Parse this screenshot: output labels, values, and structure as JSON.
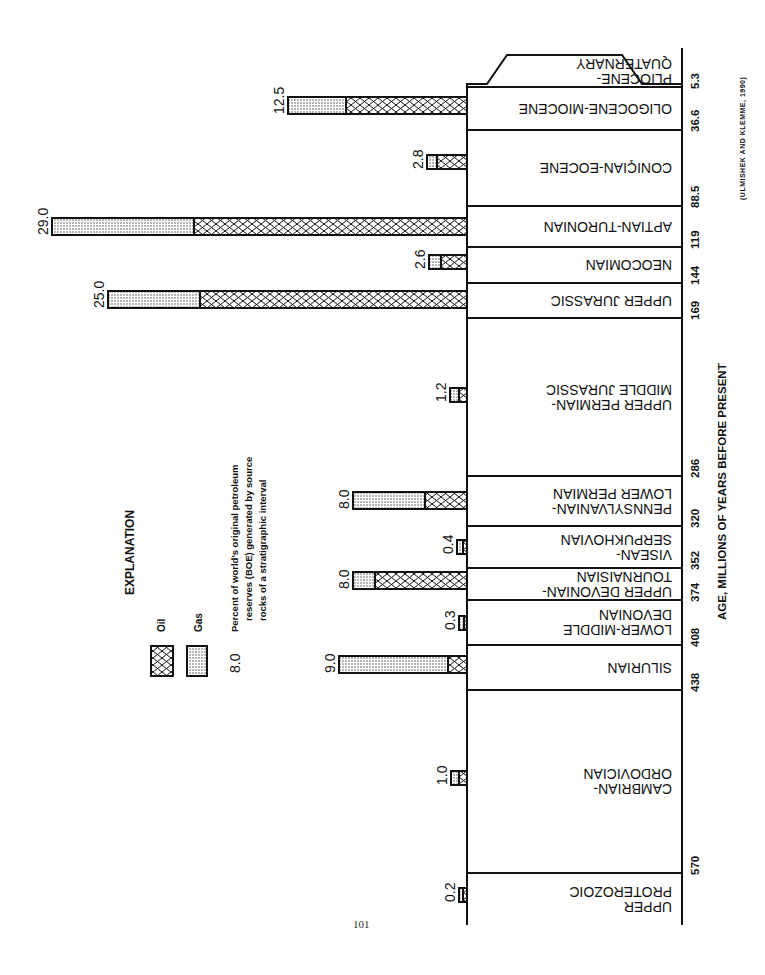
{
  "page": {
    "number": "101"
  },
  "chart_data": {
    "type": "bar",
    "orientation": "horizontal (figure rotated 90°, intervals read top=youngest)",
    "title": "",
    "xlabel": "AGE, MILLIONS OF YEARS BEFORE PRESENT",
    "ylabel": "Percent of world's original petroleum reserves (BOE) generated by source rocks of a stratigraphic interval",
    "source": "(ULMISHEK AND KLEMME, 1990)",
    "legend": {
      "title": "EXPLANATION",
      "entries": [
        {
          "name": "Oil",
          "pattern": "crosshatch"
        },
        {
          "name": "Gas",
          "pattern": "stipple"
        }
      ],
      "example_value": "8.0",
      "example_text": [
        "Percent of world's original petroleum",
        "reserves (BOE) generated by source",
        "rocks of a stratigraphic interval"
      ]
    },
    "age_ticks": [
      "5.3",
      "36.6",
      "88.5",
      "119",
      "144",
      "169",
      "286",
      "320",
      "352",
      "374",
      "408",
      "438",
      "570"
    ],
    "categories": [
      "PLIOCENE-QUATERNARY",
      "OLIGOCENE-MIOCENE",
      "CONIACIAN-EOCENE",
      "APTIAN-TURONIAN",
      "NEOCOMIAN",
      "UPPER JURASSIC",
      "UPPER PERMIAN-MIDDLE JURASSIC",
      "PENNSYLVANIAN-LOWER PERMIAN",
      "VISEAN-SERPUKHOVIAN",
      "UPPER DEVONIAN-TOURNAISIAN",
      "LOWER-MIDDLE DEVONIAN",
      "SILURIAN",
      "CAMBRIAN-ORDOVICIAN",
      "UPPER PROTEROZOIC"
    ],
    "values": [
      null,
      12.5,
      2.8,
      29.0,
      2.6,
      25.0,
      1.2,
      8.0,
      0.4,
      8.0,
      0.3,
      9.0,
      1.0,
      0.2
    ],
    "series": [
      {
        "name": "Oil",
        "values": [
          null,
          8.5,
          2.1,
          19.0,
          1.8,
          18.7,
          0.6,
          2.8,
          0.3,
          6.5,
          0.2,
          1.3,
          0.7,
          0.1
        ]
      },
      {
        "name": "Gas",
        "values": [
          null,
          4.0,
          0.7,
          10.0,
          0.8,
          6.3,
          0.6,
          5.2,
          0.1,
          1.5,
          0.1,
          7.7,
          0.3,
          0.1
        ]
      }
    ],
    "xlim": [
      0,
      30
    ],
    "grid": false
  },
  "intervals": [
    {
      "label_lines": [
        "PLIOCENE-",
        "QUATERNARY"
      ],
      "top": 55,
      "bottom": 87,
      "value": null,
      "split": null,
      "shape": "trapezoid"
    },
    {
      "label_lines": [
        "OLIGOCENE-MIOCENE"
      ],
      "top": 87,
      "bottom": 130,
      "value": "12.5",
      "bar_left": 288,
      "split": 346,
      "bar_y": 97
    },
    {
      "label_lines": [
        "CONIÇIAN-EOCENE"
      ],
      "top": 130,
      "bottom": 206,
      "value": "2.8",
      "bar_left": 427,
      "split": 437,
      "bar_y": 155
    },
    {
      "label_lines": [
        "APTIAN-TURONIAN"
      ],
      "top": 206,
      "bottom": 247,
      "value": "29.0",
      "bar_left": 52,
      "split": 194,
      "bar_y": 218
    },
    {
      "label_lines": [
        "NEOCOMIAN"
      ],
      "top": 247,
      "bottom": 283,
      "value": "2.6",
      "bar_left": 429,
      "split": 441,
      "bar_y": 255
    },
    {
      "label_lines": [
        "UPPER JURASSIC"
      ],
      "top": 283,
      "bottom": 318,
      "value": "25.0",
      "bar_left": 108,
      "split": 200,
      "bar_y": 291
    },
    {
      "label_lines": [
        "UPPER PERMIAN-",
        "MIDDLE JURASSIC"
      ],
      "top": 318,
      "bottom": 476,
      "value": "1.2",
      "bar_left": 450,
      "split": 459,
      "bar_y": 388
    },
    {
      "label_lines": [
        "PENNSYLVANIAN-",
        "LOWER PERMIAN"
      ],
      "top": 476,
      "bottom": 526,
      "value": "8.0",
      "bar_left": 353,
      "split": 425,
      "bar_y": 492
    },
    {
      "label_lines": [
        "VISEAN-",
        "SERPUKHOVIAN"
      ],
      "top": 526,
      "bottom": 568,
      "value": "0.4",
      "bar_left": 457,
      "split": 463,
      "bar_y": 540
    },
    {
      "label_lines": [
        "UPPER DEVONIAN-",
        "TOURNAISIAN"
      ],
      "top": 568,
      "bottom": 600,
      "value": "8.0",
      "bar_left": 353,
      "split": 375,
      "bar_y": 572
    },
    {
      "label_lines": [
        "LOWER-MIDDLE",
        "DEVONIAN"
      ],
      "top": 600,
      "bottom": 645,
      "value": "0.3",
      "bar_left": 459,
      "split": 464,
      "bar_y": 616
    },
    {
      "label_lines": [
        "SILURIAN"
      ],
      "top": 645,
      "bottom": 690,
      "value": "9.0",
      "bar_left": 339,
      "split": 448,
      "bar_y": 656
    },
    {
      "label_lines": [
        "CAMBRIAN-",
        "ORDOVICIAN"
      ],
      "top": 690,
      "bottom": 873,
      "value": "1.0",
      "bar_left": 451,
      "split": 459,
      "bar_y": 771
    },
    {
      "label_lines": [
        "UPPER",
        "PROTEROZOIC"
      ],
      "top": 873,
      "bottom": 925,
      "value": "0.2",
      "bar_left": 459,
      "split": 463,
      "bar_y": 888
    }
  ],
  "ticks": [
    {
      "label": "5.3",
      "y": 87
    },
    {
      "label": "36.6",
      "y": 130
    },
    {
      "label": "88.5",
      "y": 206
    },
    {
      "label": "119",
      "y": 247
    },
    {
      "label": "144",
      "y": 283
    },
    {
      "label": "169",
      "y": 318
    },
    {
      "label": "286",
      "y": 476
    },
    {
      "label": "320",
      "y": 526
    },
    {
      "label": "352",
      "y": 568
    },
    {
      "label": "374",
      "y": 600
    },
    {
      "label": "408",
      "y": 645
    },
    {
      "label": "438",
      "y": 690
    },
    {
      "label": "570",
      "y": 873
    }
  ],
  "axis_label": "AGE, MILLIONS OF YEARS BEFORE PRESENT",
  "citation": "(ULMISHEK AND KLEMME, 1990)",
  "explanation": {
    "title": "EXPLANATION",
    "oil_label": "Oil",
    "gas_label": "Gas",
    "value_example": "8.0",
    "desc_lines": [
      "Percent of world's original petroleum",
      "reserves (BOE) generated by source",
      "rocks of a stratigraphic interval"
    ]
  },
  "colors": {
    "ink": "#111111",
    "paper": "#ffffff"
  }
}
